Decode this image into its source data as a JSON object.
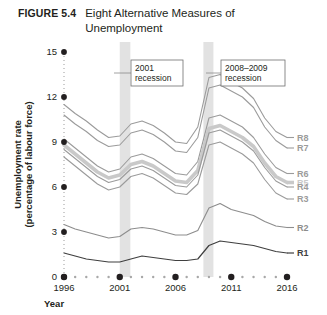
{
  "figure": {
    "number": "FIGURE 5.4",
    "title": "Eight Alternative Measures of Unemployment"
  },
  "chart_data": {
    "type": "line",
    "title": "Eight Alternative Measures of Unemployment",
    "xlabel": "Year",
    "ylabel": "Unemployment rate (percentage of labour force)",
    "xlim": [
      1996,
      2016
    ],
    "ylim": [
      0,
      15
    ],
    "yticks": [
      0,
      3,
      6,
      9,
      12,
      15
    ],
    "xticks": [
      1996,
      2001,
      2006,
      2011,
      2016
    ],
    "x_minor_step": 1,
    "grid": false,
    "legend": "right-of-axis series labels",
    "x": [
      1996,
      1997,
      1998,
      1999,
      2000,
      2001,
      2002,
      2003,
      2004,
      2005,
      2006,
      2007,
      2008,
      2009,
      2010,
      2011,
      2012,
      2013,
      2014,
      2015,
      2016
    ],
    "series": [
      {
        "name": "R8",
        "label": "R8",
        "color": "#9b9b9b",
        "width": 1.1,
        "values": [
          11.5,
          10.9,
          10.4,
          9.8,
          9.3,
          9.4,
          10.2,
          10.4,
          10.1,
          9.6,
          9.0,
          8.9,
          10.0,
          13.3,
          13.5,
          13.0,
          12.6,
          11.9,
          10.6,
          9.7,
          9.3
        ]
      },
      {
        "name": "R7",
        "label": "R7",
        "color": "#9b9b9b",
        "width": 1.1,
        "values": [
          10.8,
          10.2,
          9.7,
          9.1,
          8.7,
          8.8,
          9.6,
          9.8,
          9.5,
          9.0,
          8.4,
          8.3,
          9.3,
          12.6,
          12.8,
          12.4,
          12.0,
          11.3,
          10.0,
          9.1,
          8.6
        ]
      },
      {
        "name": "R6",
        "label": "R6",
        "color": "#9b9b9b",
        "width": 1.1,
        "values": [
          9.2,
          8.6,
          8.0,
          7.4,
          7.0,
          7.2,
          8.0,
          8.2,
          7.9,
          7.4,
          6.9,
          6.8,
          7.7,
          10.6,
          10.8,
          10.4,
          10.0,
          9.3,
          8.2,
          7.3,
          6.9
        ]
      },
      {
        "name": "R5",
        "label": "R5",
        "color": "#c9c9c9",
        "width": 3.6,
        "values": [
          8.8,
          8.2,
          7.6,
          7.0,
          6.6,
          6.8,
          7.5,
          7.7,
          7.4,
          6.9,
          6.4,
          6.3,
          7.1,
          9.9,
          10.1,
          9.7,
          9.3,
          8.7,
          7.6,
          6.7,
          6.3
        ]
      },
      {
        "name": "R4",
        "label": "R4",
        "color": "#9b9b9b",
        "width": 1.1,
        "values": [
          8.5,
          7.9,
          7.3,
          6.7,
          6.3,
          6.5,
          7.2,
          7.4,
          7.1,
          6.6,
          6.1,
          6.0,
          6.8,
          9.6,
          9.8,
          9.4,
          9.0,
          8.4,
          7.3,
          6.4,
          6.0
        ]
      },
      {
        "name": "R3",
        "label": "R3",
        "color": "#9b9b9b",
        "width": 1.1,
        "values": [
          8.0,
          7.4,
          6.8,
          6.2,
          5.8,
          6.0,
          6.7,
          6.9,
          6.6,
          6.1,
          5.6,
          5.5,
          6.2,
          8.8,
          9.0,
          8.6,
          8.2,
          7.6,
          6.5,
          5.6,
          5.2
        ]
      },
      {
        "name": "R2",
        "label": "R2",
        "color": "#8d8d8d",
        "width": 1.1,
        "values": [
          3.5,
          3.2,
          3.0,
          2.8,
          2.6,
          2.7,
          3.2,
          3.3,
          3.2,
          3.0,
          2.8,
          2.8,
          3.1,
          4.6,
          4.9,
          4.5,
          4.3,
          4.1,
          3.7,
          3.4,
          3.3
        ]
      },
      {
        "name": "R1",
        "label": "R1",
        "color": "#3f3f3f",
        "width": 1.2,
        "values": [
          1.6,
          1.4,
          1.2,
          1.1,
          1.0,
          1.0,
          1.2,
          1.4,
          1.3,
          1.2,
          1.1,
          1.1,
          1.2,
          2.1,
          2.4,
          2.3,
          2.2,
          2.1,
          1.9,
          1.7,
          1.6
        ]
      }
    ],
    "annotations": [
      {
        "id": "rec-2001",
        "text_line1": "2001",
        "text_line2": "recession",
        "band_start": 2001.0,
        "band_end": 2001.95
      },
      {
        "id": "rec-2008",
        "text_line1": "2008–2009",
        "text_line2": "recession",
        "band_start": 2008.5,
        "band_end": 2009.4
      }
    ],
    "band_color": "#e2e2e2"
  }
}
